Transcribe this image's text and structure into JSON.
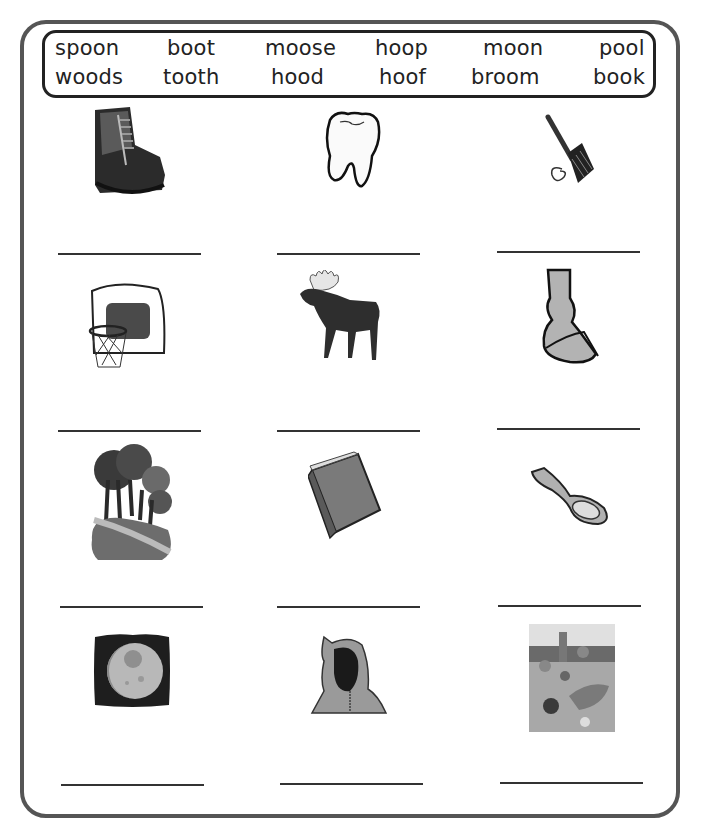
{
  "word_bank": {
    "row1": [
      "spoon",
      "boot",
      "moose",
      "hoop",
      "moon",
      "pool"
    ],
    "row2": [
      "woods",
      "tooth",
      "hood",
      "hoof",
      "broom",
      "book"
    ]
  },
  "pictures": [
    {
      "row": 1,
      "col": 1,
      "depicts": "boot"
    },
    {
      "row": 1,
      "col": 2,
      "depicts": "tooth"
    },
    {
      "row": 1,
      "col": 3,
      "depicts": "broom"
    },
    {
      "row": 2,
      "col": 1,
      "depicts": "hoop"
    },
    {
      "row": 2,
      "col": 2,
      "depicts": "moose"
    },
    {
      "row": 2,
      "col": 3,
      "depicts": "hoof"
    },
    {
      "row": 3,
      "col": 1,
      "depicts": "woods"
    },
    {
      "row": 3,
      "col": 2,
      "depicts": "book"
    },
    {
      "row": 3,
      "col": 3,
      "depicts": "spoon"
    },
    {
      "row": 4,
      "col": 1,
      "depicts": "moon"
    },
    {
      "row": 4,
      "col": 2,
      "depicts": "hood"
    },
    {
      "row": 4,
      "col": 3,
      "depicts": "pool"
    }
  ],
  "answer_lines": [
    "",
    "",
    "",
    "",
    "",
    "",
    "",
    "",
    "",
    "",
    "",
    ""
  ]
}
